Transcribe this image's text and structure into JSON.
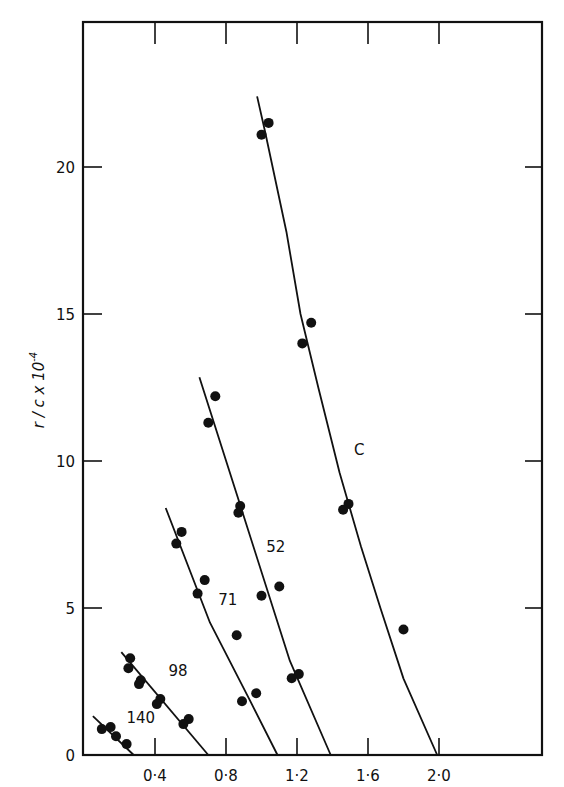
{
  "chart_data": {
    "type": "line",
    "title": "",
    "xlabel": "",
    "ylabel": "r / c x 10^-4",
    "ylabel_display": {
      "main": "r / c x 10",
      "sup": "-4"
    },
    "xlim": [
      0,
      2.6
    ],
    "ylim": [
      0,
      24.9
    ],
    "grid": false,
    "legend": "none (series labelled inline)",
    "x_ticks": [
      {
        "value": 0.4,
        "label": "0·4"
      },
      {
        "value": 0.8,
        "label": "0·8"
      },
      {
        "value": 1.2,
        "label": "1·2"
      },
      {
        "value": 1.6,
        "label": "1·6"
      },
      {
        "value": 2.0,
        "label": "2·0"
      }
    ],
    "y_ticks": [
      {
        "value": 0,
        "label": "0"
      },
      {
        "value": 5,
        "label": "5"
      },
      {
        "value": 10,
        "label": "10"
      },
      {
        "value": 15,
        "label": "15"
      },
      {
        "value": 20,
        "label": "20"
      }
    ],
    "series": [
      {
        "name": "140",
        "label": "140",
        "label_pos": [
          0.32,
          1.1
        ],
        "points": [
          [
            0.1,
            0.88
          ],
          [
            0.15,
            0.95
          ],
          [
            0.18,
            0.64
          ],
          [
            0.24,
            0.37
          ]
        ],
        "fit_line": [
          [
            0.05,
            1.32
          ],
          [
            0.28,
            0.0
          ]
        ]
      },
      {
        "name": "98",
        "label": "98",
        "label_pos": [
          0.53,
          2.7
        ],
        "points": [
          [
            0.26,
            3.29
          ],
          [
            0.25,
            2.95
          ],
          [
            0.32,
            2.54
          ],
          [
            0.31,
            2.41
          ],
          [
            0.43,
            1.9
          ],
          [
            0.41,
            1.73
          ],
          [
            0.59,
            1.22
          ],
          [
            0.56,
            1.05
          ]
        ],
        "fit_line": [
          [
            0.21,
            3.5
          ],
          [
            0.7,
            0.0
          ]
        ]
      },
      {
        "name": "71",
        "label": "71",
        "label_pos": [
          0.81,
          5.1
        ],
        "points": [
          [
            0.55,
            7.59
          ],
          [
            0.52,
            7.19
          ],
          [
            0.68,
            5.95
          ],
          [
            0.64,
            5.49
          ],
          [
            0.86,
            4.07
          ],
          [
            0.97,
            2.1
          ],
          [
            0.89,
            1.83
          ]
        ],
        "fit_line": [
          [
            0.46,
            8.4
          ],
          [
            0.71,
            4.5
          ],
          [
            0.94,
            1.8
          ],
          [
            1.09,
            0.0
          ]
        ]
      },
      {
        "name": "52",
        "label": "52",
        "label_pos": [
          1.08,
          6.9
        ],
        "points": [
          [
            0.74,
            12.2
          ],
          [
            0.7,
            11.3
          ],
          [
            0.88,
            8.47
          ],
          [
            0.87,
            8.24
          ],
          [
            1.1,
            5.73
          ],
          [
            1.0,
            5.42
          ],
          [
            1.21,
            2.75
          ],
          [
            1.17,
            2.61
          ]
        ],
        "fit_line": [
          [
            0.65,
            12.85
          ],
          [
            0.88,
            8.5
          ],
          [
            1.16,
            3.2
          ],
          [
            1.39,
            0.0
          ]
        ]
      },
      {
        "name": "C",
        "label": "C",
        "label_pos": [
          1.55,
          10.2
        ],
        "points": [
          [
            1.04,
            21.5
          ],
          [
            1.0,
            21.1
          ],
          [
            1.28,
            14.7
          ],
          [
            1.23,
            14.0
          ],
          [
            1.49,
            8.54
          ],
          [
            1.46,
            8.34
          ],
          [
            1.8,
            4.27
          ]
        ],
        "fit_line": [
          [
            0.975,
            22.4
          ],
          [
            1.02,
            21.2
          ],
          [
            1.14,
            17.8
          ],
          [
            1.22,
            15.0
          ],
          [
            1.32,
            12.5
          ],
          [
            1.44,
            9.6
          ],
          [
            1.56,
            7.1
          ],
          [
            1.67,
            5.0
          ],
          [
            1.8,
            2.6
          ],
          [
            1.99,
            0.0
          ]
        ]
      }
    ]
  },
  "plot_box": {
    "left": 83,
    "top": 22,
    "right": 542,
    "bottom": 755
  },
  "axis_map": {
    "x0_px": 84,
    "px_per_x": 177.5,
    "y0_px": 755,
    "px_per_y": 29.4
  },
  "colors": {
    "ink": "#111111",
    "background": "#ffffff"
  }
}
